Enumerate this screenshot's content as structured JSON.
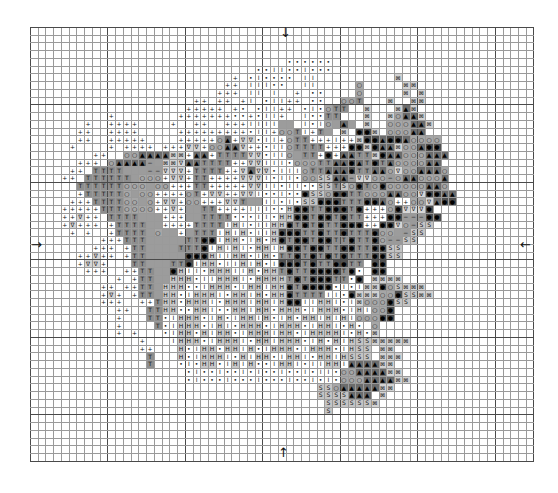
{
  "chart_data": {
    "type": "table",
    "title": "",
    "grid": {
      "columns": 65,
      "rows": 56,
      "major_every": 10,
      "origin_x": 30,
      "origin_y": 27,
      "cell_size": 7.75
    },
    "center_arrows": {
      "top": "↓",
      "bottom": "↑",
      "left": "→",
      "right": "←"
    },
    "legend": {
      "+": {
        "glyph": "+",
        "bg": "#ffffff"
      },
      "V": {
        "glyph": "∇",
        "bg": "#d6d6d6"
      },
      "T": {
        "glyph": "T",
        "bg": "#8e8e8e"
      },
      "O": {
        "glyph": "○",
        "bg": "#a6a6a6"
      },
      "A": {
        "glyph": "▲",
        "bg": "#6c6c6c"
      },
      "*": {
        "glyph": "●",
        "bg": "#4f4f4f"
      },
      "H": {
        "glyph": "H",
        "bg": "#c8c8c8"
      },
      "I": {
        "glyph": "I",
        "bg": "#ffffff"
      },
      "d": {
        "glyph": "•",
        "bg": "#ffffff"
      },
      "S": {
        "glyph": "S",
        "bg": "#c4c4c4"
      },
      "X": {
        "glyph": "⊠",
        "bg": "#d2d2d2"
      },
      "-": {
        "glyph": "−",
        "bg": "#9a9a9a"
      },
      "o": {
        "glyph": "⊙",
        "bg": "#dcdcdc"
      },
      "g": {
        "glyph": "",
        "bg": "#9c9c9c"
      }
    },
    "rows": [
      ".................................................................",
      ".................................................................",
      ".................................................................",
      ".................................................................",
      ".................................dddddd..........................",
      ".............................ddIIddIddd..........................",
      "..........................+.dIdddd.II..........X................",
      ".........................++.IIIdd..II.....O.....XX...............",
      "........................+++.II.I..+.dd....O.....X.X..............",
      ".....................++.++.+I.dII++.dd..OOT...X..XX..............",
      "....................+++++.+d.dII++.dIdOTT..X...XAX...............",
      "..........+........+++++++dd+dII+..IddTT...X..XOAAX..............",
      ".......+..++++....+..++..+++IIIIgg.IdIOgAg.X..OOOAAX.............",
      "......++..++++.....+++++++++dII+OOTI+Tg.X.**X.OOOAA..............",
      "......++..+++++....+++++OA+VVdII+OTT+++I++X**A**AOOOO............",
      ".....+....+.++++.+++VV+OOAAV++dIIOTTTT+++**X*AAXOOA**............",
      "........++..OOAAAAXX+AA+TTTTVVdIIOgTT+*+AATTX*AAOOOAAA...........",
      "......+++.OAAAA-gXXVAATTTT++VVIIIdOOOTTAA*AT*TAOOOOAA............",
      ".....++.TTTTggg--VVV+TTTT++VAVVdIIIOTTAAA*TTAAOVOOAAAO...........",
      "....++.TTTTTTgOOO+VV+TT++++VVVIdIIdOOSSAA-VVOO-OAAOOOA...........",
      "......TTTTTTOOOgOO+++TT+++++VVIIdIIddSSTSO*TO*OOOOOAAO...........",
      "......+TTTTTOgOO++++OT+VV++VVIddIdd*SSO**TTOOOAAOOV**AA..........",
      ".....+++TTTTOOgO+VV+OO+++VVTggIIdIdSS***TTT**AO++OOVA**..........",
      "....+++++TTTOOOO++V+ggTT++++IIIddH**TT***T*+++O*VVV*.............",
      "....++V++.TTTTggg+++ggTTTTdddIIdHH**T**T*TT+++**---**............",
      "....+V+++.+TTTTgg++++TTTTIHIdIIHH*T*T*TT***++**VO-SS.............",
      ".....+.+..+TTTTgOgg+gTTTIHIHdIIH***TT*TT*TTT*OOg-SS..............",
      ".........+++TTTgggggTT**IHHdIHdH*T**T**TT*TT*O--SS...............",
      "........+++.+TTggggTTT*IHIHIdHHIH**T**TT**TT**SS.................",
      "......++V++.+TTggggg***HIIHHdIHdTT*T*T*T*TTT**SS.................",
      "......+VV+...TTgggTT*IHHdIIHIHdI***T*TT**TT.**...................",
      ".......+++..++TTgg*HIIdHHHIIHdHHT*TT****T*d.**...................",
      "...........+.+TTggHHHdIIHHHIdHHHHT*T***TTd*.XXXX.................",
      ".........++.++TTgHHHddIHHHdIHHIHH*T****dIdIXX*OSXXX..............",
      ".........+V+.+TTgHHdIHHHIdHHIHdHH*TTTTIId*XXXOO*SSXX.............",
      ".........+++..++THHdHHHIdHHHIHHIH**IIHHIdIXOOO*SS................",
      "...........++..TTHHddHHIddHHIHHdHHHdIHHHdIHIOO*..................",
      "...........+...TTdIHHHdIHdIHHIHdIHdHHIHIHIOOO**..................",
      "...........+....TdIHHHdIHIdHHHdIHHHdIHHIdHd.O....................",
      "...........+.+...dIHHdHIHHdIHHHIHHdIHHHHIdHdX....................",
      "..............+...IHHHdIHHHIdHHIHHHdIHdHIHSSXXXXX................",
      "..............++...HdIHHdHHIHdIHHHdIHHHdIHSS.XX..................",
      "...............T...HdIHHHIdHIHHdIHHIdHHIHSSS.XXX.................",
      "...............T...dIdHHdIHIHddIHHIdIIHHIAAAAXX..................",
      "....................dIddIddIdIddIddIdIIdOOAAAAXX.................",
      "....................dIdddIdddIdddIddIdIdOOOAAAAXX................",
      ".....................................SSOAAAAAXX..................",
      ".....................................SSSSAAA.X...................",
      "......................................SSSSSSX....................",
      "......................................S.........................",
      ".................................................................",
      ".................................................................",
      ".................................................................",
      ".................................................................",
      ".................................................................",
      "................................................................."
    ]
  }
}
